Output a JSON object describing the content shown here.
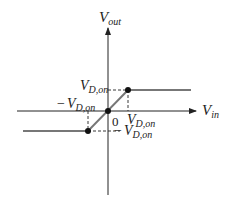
{
  "diagram": {
    "axes": {
      "y_label": "V",
      "y_label_sub": "out",
      "x_label": "V",
      "x_label_sub": "in",
      "origin_label": "0"
    },
    "annotations": {
      "pos_vout": {
        "main": "V",
        "sub": "D,on"
      },
      "neg_vin": {
        "prefix": "−",
        "main": "V",
        "sub": "D,on"
      },
      "pos_vin": {
        "main": "V",
        "sub": "D,on"
      },
      "neg_vout": {
        "prefix": "−",
        "main": "V",
        "sub": "D,on"
      }
    },
    "curve": {
      "description": "Output clamps at -VD,on for Vin < -VD,on, linear with slope 1 through origin, clamps at +VD,on for Vin > VD,on",
      "points": [
        {
          "vin": "-inf",
          "vout": "-VD,on"
        },
        {
          "vin": "-VD,on",
          "vout": "-VD,on"
        },
        {
          "vin": "0",
          "vout": "0"
        },
        {
          "vin": "VD,on",
          "vout": "VD,on"
        },
        {
          "vin": "+inf",
          "vout": "VD,on"
        }
      ]
    },
    "colors": {
      "axis": "#222222",
      "curve": "#777777",
      "dots": "#111111",
      "dashes": "#222222"
    }
  }
}
